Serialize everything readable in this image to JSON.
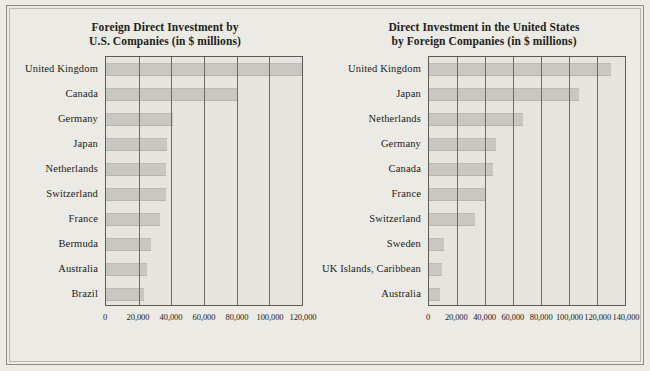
{
  "page": {
    "background_color": "#ebe9e3",
    "bar_color": "#c9c7c2",
    "axis_color": "#5d5b57",
    "text_color": "#1d1a18"
  },
  "chart_data": [
    {
      "id": "left",
      "type": "bar",
      "orientation": "horizontal",
      "title": "Foreign Direct Investment by",
      "subtitle": "U.S. Companies  (in $ millions)",
      "xlabel": "",
      "ylabel": "",
      "xlim": [
        0,
        120000
      ],
      "grid": true,
      "grid_axis": "x",
      "legend": "none",
      "tick_labels": [
        "0",
        "20,000",
        "40,000",
        "60,000",
        "80,000",
        "100,000",
        "120,000"
      ],
      "ticks": [
        0,
        20000,
        40000,
        60000,
        80000,
        100000,
        120000
      ],
      "categories": [
        "United Kingdom",
        "Canada",
        "Germany",
        "Japan",
        "Netherlands",
        "Switzerland",
        "France",
        "Bermuda",
        "Australia",
        "Brazil"
      ],
      "values": [
        120000,
        80000,
        41000,
        37500,
        37000,
        36500,
        33000,
        27500,
        25000,
        23500
      ]
    },
    {
      "id": "right",
      "type": "bar",
      "orientation": "horizontal",
      "title": "Direct Investment in the United States",
      "subtitle": "by Foreign Companies  (in $ millions)",
      "xlabel": "",
      "ylabel": "",
      "xlim": [
        0,
        140000
      ],
      "grid": true,
      "grid_axis": "x",
      "legend": "none",
      "tick_labels": [
        "0",
        "20,000",
        "40,000",
        "60,000",
        "80,000",
        "100,000",
        "120,000",
        "140,000"
      ],
      "ticks": [
        0,
        20000,
        40000,
        60000,
        80000,
        100000,
        120000,
        140000
      ],
      "categories": [
        "United Kingdom",
        "Japan",
        "Netherlands",
        "Germany",
        "Canada",
        "France",
        "Switzerland",
        "Sweden",
        "UK Islands, Caribbean",
        "Australia"
      ],
      "values": [
        130000,
        107000,
        67000,
        48000,
        46000,
        41000,
        33000,
        11000,
        9500,
        8000
      ]
    }
  ]
}
